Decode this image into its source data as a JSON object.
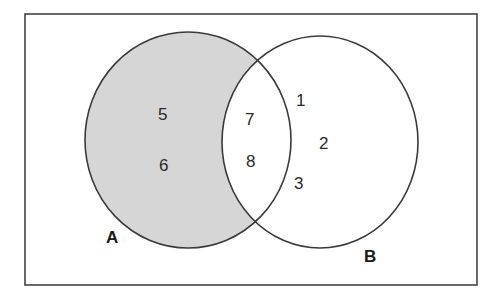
{
  "diagram": {
    "type": "venn",
    "universe": {
      "label": ""
    },
    "sets": [
      {
        "name": "A",
        "label": "A",
        "shaded": true,
        "elements_only": [
          "5",
          "6"
        ]
      },
      {
        "name": "B",
        "label": "B",
        "shaded": false,
        "elements_only": [
          "1",
          "2",
          "3"
        ]
      }
    ],
    "intersection": [
      "7",
      "8"
    ],
    "elements": {
      "e5": "5",
      "e6": "6",
      "e7": "7",
      "e8": "8",
      "e1": "1",
      "e2": "2",
      "e3": "3"
    },
    "labels": {
      "a": "A",
      "b": "B"
    },
    "colors": {
      "shade": "#d6d6d6",
      "stroke": "#3a3a3a",
      "background": "#ffffff"
    }
  }
}
